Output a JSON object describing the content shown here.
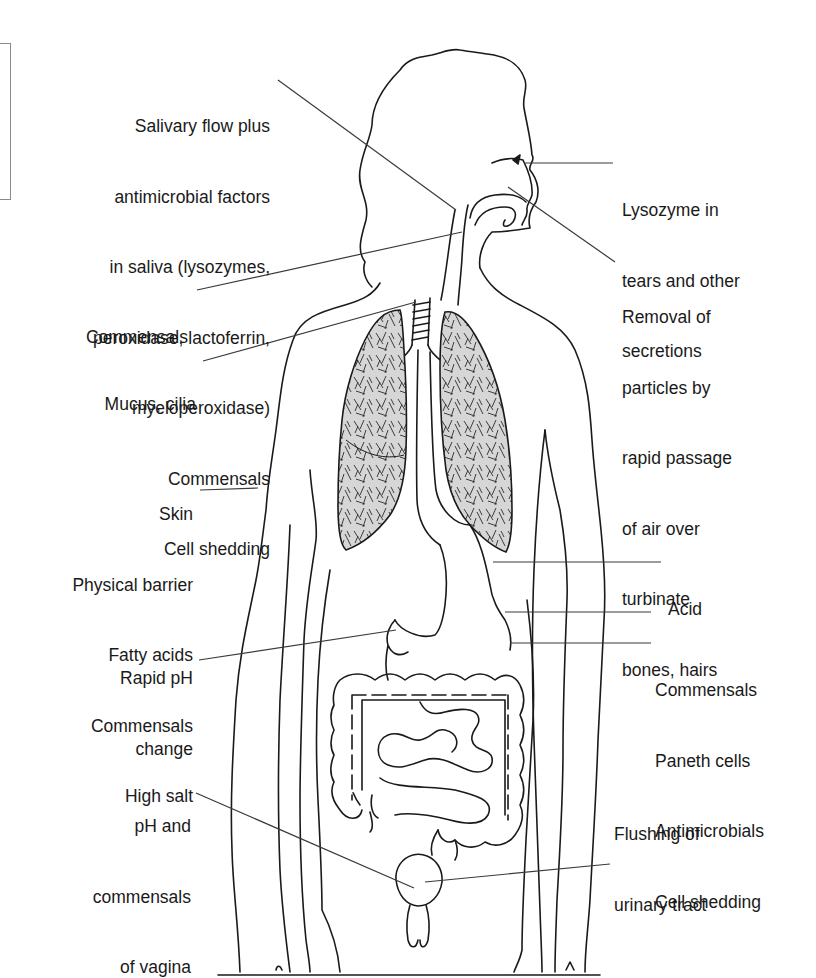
{
  "figure": {
    "colors": {
      "line": "#1a1a1a",
      "leader": "#3a3a3a",
      "lung_fill": "#d6d6d6",
      "edge_box": "#8a8a8a"
    }
  },
  "labels": {
    "salivary": {
      "lines": [
        "Salivary flow plus",
        "antimicrobial factors",
        "in saliva (lysozymes,",
        "peroxidase, lactoferrin,",
        "myeloperoxidase)",
        "Commensals",
        "Cell shedding"
      ]
    },
    "lysozyme": {
      "lines": [
        "Lysozyme in",
        "tears and other",
        "secretions"
      ]
    },
    "nasal": {
      "lines": [
        "Removal of",
        "particles by",
        "rapid passage",
        "of air over",
        "turbinate",
        "bones, hairs"
      ]
    },
    "throat_commensals": {
      "lines": [
        "Commensals"
      ]
    },
    "mucus": {
      "lines": [
        "Mucus, cilia"
      ]
    },
    "skin": {
      "lines": [
        "Skin",
        "Physical barrier",
        "Fatty acids",
        "Commensals",
        "High salt"
      ]
    },
    "acid": {
      "lines": [
        "Acid"
      ]
    },
    "ph_change": {
      "lines": [
        "Rapid pH",
        "change"
      ]
    },
    "intestine": {
      "lines": [
        "Commensals",
        "Paneth cells",
        "Antimicrobials",
        "Cell shedding"
      ]
    },
    "urinary": {
      "lines": [
        "Flushing of",
        "urinary tract"
      ]
    },
    "vagina": {
      "lines": [
        "pH and",
        "commensals",
        "of vagina"
      ]
    }
  }
}
